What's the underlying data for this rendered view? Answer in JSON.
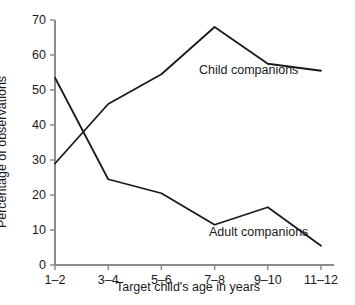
{
  "chart_data": {
    "type": "line",
    "title": "",
    "xlabel": "Target child's age in years",
    "ylabel": "Percentage of observations",
    "categories": [
      "1–2",
      "3–4",
      "5–6",
      "7–8",
      "9–10",
      "11–12"
    ],
    "ylim": [
      0,
      70
    ],
    "yticks": [
      "0",
      "10",
      "20",
      "30",
      "40",
      "50",
      "60",
      "70"
    ],
    "ytick_values": [
      0,
      10,
      20,
      30,
      40,
      50,
      60,
      70
    ],
    "grid": false,
    "legend_position": "inline-annotations",
    "series": [
      {
        "name": "Child companions",
        "values": [
          29,
          46,
          54.5,
          68,
          57.5,
          55.5
        ],
        "color": "#1a1a1a"
      },
      {
        "name": "Adult companions",
        "values": [
          53.5,
          24.5,
          20.5,
          11.5,
          16.5,
          5.5
        ],
        "color": "#1a1a1a"
      }
    ],
    "annotations": [
      {
        "text": "Child companions",
        "series": "Child companions"
      },
      {
        "text": "Adult companions",
        "series": "Adult companions"
      }
    ]
  },
  "axes": {
    "y_title": "Percentage of observations",
    "x_title": "Target child's age in years"
  }
}
